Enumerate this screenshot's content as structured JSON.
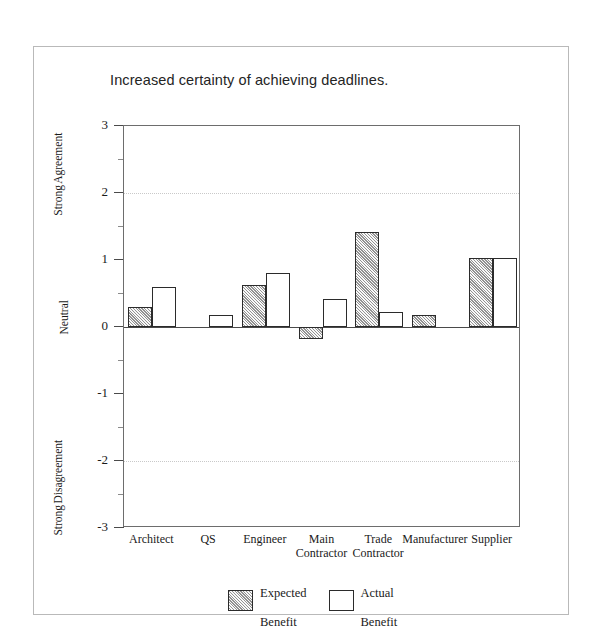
{
  "figure": {
    "frame_border_color": "#b9b9b9",
    "background": "#ffffff"
  },
  "chart_data": {
    "type": "bar",
    "title": "Increased certainty of achieving deadlines.",
    "xlabel": "",
    "ylabel": "",
    "ylim": [
      -3,
      3
    ],
    "ytick_values": [
      3,
      2,
      1,
      0,
      -1,
      -2,
      -3
    ],
    "ytick_labels": [
      "3",
      "2",
      "1",
      "0",
      "-1",
      "-2",
      "-3"
    ],
    "y_minor_ticks": [
      2.5,
      1.5,
      0.5,
      -0.5,
      -1.5,
      -2.5
    ],
    "y_axis_anchors": {
      "top": "Strong Agreement",
      "top_line1": "Strong",
      "top_line2": "Agreement",
      "middle": "Neutral",
      "bottom": "Strong Disagreement",
      "bottom_line1": "Strong",
      "bottom_line2": "Disagreement"
    },
    "grid": true,
    "gridlines_at": [
      2,
      -2
    ],
    "zero_line": 0,
    "legend_position": "bottom-center",
    "categories": [
      "Architect",
      "QS",
      "Engineer",
      "Main Contractor",
      "Trade Contractor",
      "Manufacturer",
      "Supplier"
    ],
    "category_label_lines": [
      [
        "Architect"
      ],
      [
        "QS"
      ],
      [
        "Engineer"
      ],
      [
        "Main",
        "Contractor"
      ],
      [
        "Trade",
        "Contractor"
      ],
      [
        "Manufacturer"
      ],
      [
        "Supplier"
      ]
    ],
    "series": [
      {
        "name": "Expected Benefit",
        "name_line1": "Expected",
        "name_line2": "Benefit",
        "fill": "hatched-gray",
        "color": "#d6d6d6",
        "values": [
          0.3,
          0,
          0.62,
          -0.18,
          1.42,
          0.18,
          1.03
        ]
      },
      {
        "name": "Actual Benefit",
        "name_line1": "Actual",
        "name_line2": "Benefit",
        "fill": "white",
        "color": "#ffffff",
        "values": [
          0.6,
          0.18,
          0.8,
          0.42,
          0.22,
          0,
          1.03
        ]
      }
    ]
  }
}
